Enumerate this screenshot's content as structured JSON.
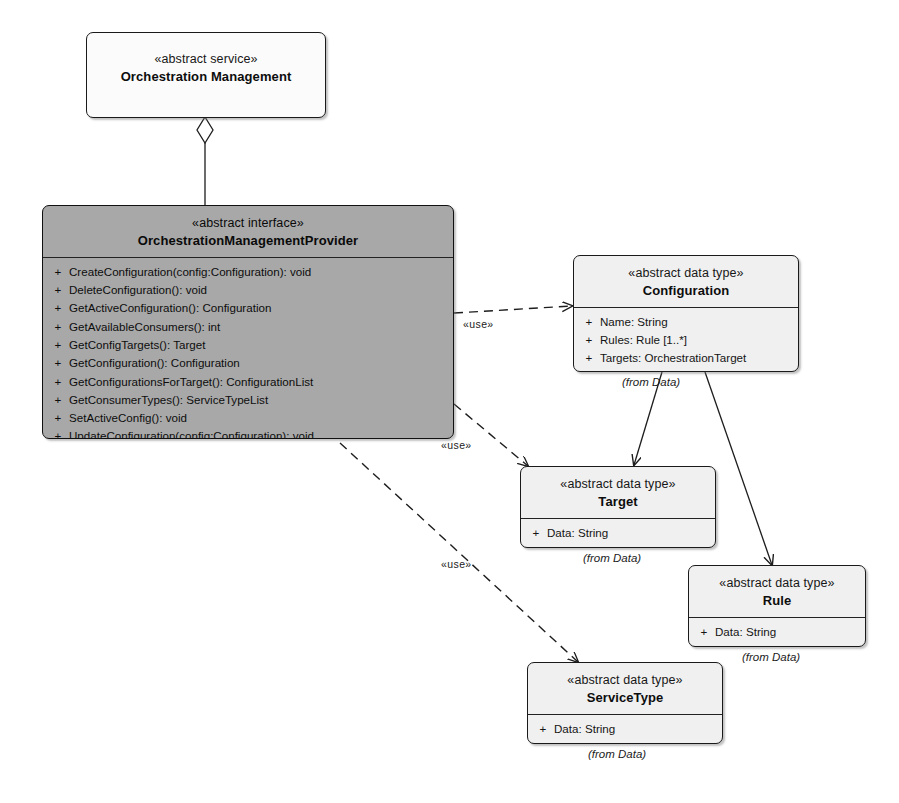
{
  "diagram": {
    "type": "uml-class-diagram",
    "background": "#ffffff",
    "classes": [
      {
        "id": "orchestration-management",
        "stereotype": "«abstract service»",
        "name": "Orchestration Management",
        "fill": "#fbfbfb",
        "members": []
      },
      {
        "id": "orchestration-management-provider",
        "stereotype": "«abstract interface»",
        "name": "OrchestrationManagementProvider",
        "fill": "#a8a8a8",
        "members": [
          {
            "visibility": "+",
            "signature": "CreateConfiguration(config:Configuration): void"
          },
          {
            "visibility": "+",
            "signature": "DeleteConfiguration(): void"
          },
          {
            "visibility": "+",
            "signature": "GetActiveConfiguration(): Configuration"
          },
          {
            "visibility": "+",
            "signature": "GetAvailableConsumers(): int"
          },
          {
            "visibility": "+",
            "signature": "GetConfigTargets(): Target"
          },
          {
            "visibility": "+",
            "signature": "GetConfiguration(): Configuration"
          },
          {
            "visibility": "+",
            "signature": "GetConfigurationsForTarget(): ConfigurationList"
          },
          {
            "visibility": "+",
            "signature": "GetConsumerTypes(): ServiceTypeList"
          },
          {
            "visibility": "+",
            "signature": "SetActiveConfig(): void"
          },
          {
            "visibility": "+",
            "signature": "UpdateConfiguration(config:Configuration): void"
          }
        ]
      },
      {
        "id": "configuration",
        "stereotype": "«abstract data type»",
        "name": "Configuration",
        "fill": "#f3f3f3",
        "from": "(from Data)",
        "members": [
          {
            "visibility": "+",
            "signature": "Name: String"
          },
          {
            "visibility": "+",
            "signature": "Rules: Rule [1..*]"
          },
          {
            "visibility": "+",
            "signature": "Targets: OrchestrationTarget"
          }
        ]
      },
      {
        "id": "target",
        "stereotype": "«abstract data type»",
        "name": "Target",
        "fill": "#f3f3f3",
        "from": "(from Data)",
        "members": [
          {
            "visibility": "+",
            "signature": "Data: String"
          }
        ]
      },
      {
        "id": "rule",
        "stereotype": "«abstract data type»",
        "name": "Rule",
        "fill": "#f3f3f3",
        "from": "(from Data)",
        "members": [
          {
            "visibility": "+",
            "signature": "Data: String"
          }
        ]
      },
      {
        "id": "service-type",
        "stereotype": "«abstract data type»",
        "name": "ServiceType",
        "fill": "#f3f3f3",
        "from": "(from Data)",
        "members": [
          {
            "visibility": "+",
            "signature": "Data: String"
          }
        ]
      }
    ],
    "relationships": [
      {
        "id": "aggregation-management-provider",
        "kind": "aggregation",
        "from": "orchestration-management",
        "to": "orchestration-management-provider",
        "label": ""
      },
      {
        "id": "use-configuration",
        "kind": "dependency",
        "from": "orchestration-management-provider",
        "to": "configuration",
        "label": "«use»"
      },
      {
        "id": "use-target",
        "kind": "dependency",
        "from": "orchestration-management-provider",
        "to": "target",
        "label": "«use»"
      },
      {
        "id": "use-service-type",
        "kind": "dependency",
        "from": "orchestration-management-provider",
        "to": "service-type",
        "label": "«use»"
      },
      {
        "id": "association-configuration-target",
        "kind": "association",
        "from": "configuration",
        "to": "target",
        "label": ""
      },
      {
        "id": "association-configuration-rule",
        "kind": "association",
        "from": "configuration",
        "to": "rule",
        "label": ""
      }
    ]
  }
}
